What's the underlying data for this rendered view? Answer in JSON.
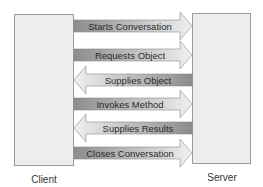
{
  "client": {
    "label": "Client"
  },
  "server": {
    "label": "Server"
  },
  "messages": [
    {
      "label": "Starts Conversation",
      "direction": "right"
    },
    {
      "label": "Requests Object",
      "direction": "right"
    },
    {
      "label": "Supplies Object",
      "direction": "left"
    },
    {
      "label": "Invokes Method",
      "direction": "right"
    },
    {
      "label": "Supplies Results",
      "direction": "left"
    },
    {
      "label": "Closes Conversation",
      "direction": "right"
    }
  ],
  "colors": {
    "box_fill": "#ededed",
    "box_border": "#9a9a9a",
    "arrow_dark": "#8c8c8c",
    "arrow_light": "#eeeeee"
  }
}
